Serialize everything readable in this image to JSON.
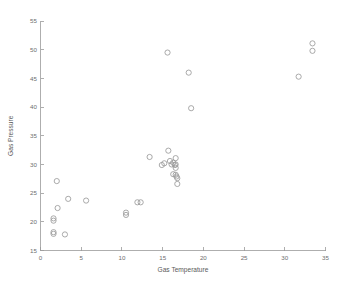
{
  "chart_data": {
    "type": "scatter",
    "title": "",
    "xlabel": "Gas Temperature",
    "ylabel": "Gas Pressure",
    "xlim": [
      0,
      35
    ],
    "ylim": [
      15,
      55
    ],
    "xticks": [
      0,
      5,
      10,
      15,
      20,
      25,
      30,
      35
    ],
    "yticks": [
      15,
      20,
      25,
      30,
      35,
      40,
      45,
      50,
      55
    ],
    "xtick_labels": [
      "0",
      "5",
      "10",
      "15",
      "20",
      "25",
      "30",
      "35"
    ],
    "ytick_labels": [
      "15",
      "20",
      "25",
      "30",
      "35",
      "40",
      "45",
      "50",
      "55"
    ],
    "grid": false,
    "legend": null,
    "marker": {
      "shape": "circle-open",
      "color": "#9b9b9b",
      "size": 2.6
    },
    "series": [
      {
        "name": "Gas measurements",
        "points": [
          [
            1.6,
            20.6
          ],
          [
            1.6,
            20.2
          ],
          [
            1.6,
            18.2
          ],
          [
            1.6,
            17.9
          ],
          [
            2.0,
            27.1
          ],
          [
            2.1,
            22.4
          ],
          [
            3.0,
            17.8
          ],
          [
            3.4,
            24.0
          ],
          [
            5.6,
            23.7
          ],
          [
            10.5,
            21.6
          ],
          [
            10.5,
            21.2
          ],
          [
            11.9,
            23.4
          ],
          [
            12.3,
            23.4
          ],
          [
            13.4,
            31.3
          ],
          [
            14.9,
            29.9
          ],
          [
            15.2,
            30.2
          ],
          [
            15.6,
            49.5
          ],
          [
            15.7,
            32.4
          ],
          [
            15.9,
            30.6
          ],
          [
            16.1,
            30.0
          ],
          [
            16.3,
            30.3
          ],
          [
            16.5,
            29.9
          ],
          [
            16.6,
            31.1
          ],
          [
            16.6,
            30.0
          ],
          [
            16.6,
            29.4
          ],
          [
            16.6,
            28.2
          ],
          [
            16.7,
            27.9
          ],
          [
            16.3,
            28.3
          ],
          [
            16.8,
            27.6
          ],
          [
            16.8,
            26.6
          ],
          [
            18.2,
            46.0
          ],
          [
            18.5,
            39.8
          ],
          [
            31.7,
            45.3
          ],
          [
            33.4,
            51.1
          ],
          [
            33.4,
            49.8
          ]
        ]
      }
    ]
  }
}
